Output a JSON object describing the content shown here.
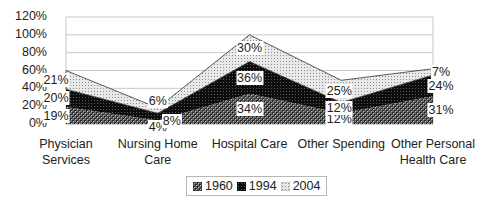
{
  "chart_data": {
    "type": "area",
    "stacked": true,
    "title": "",
    "xlabel": "",
    "ylabel": "",
    "ylim": [
      0,
      120
    ],
    "yticks": [
      "0%",
      "20%",
      "40%",
      "60%",
      "80%",
      "100%",
      "120%"
    ],
    "grid": true,
    "legend_position": "bottom",
    "categories": [
      "Physician Services",
      "Nursing Home Care",
      "Hospital Care",
      "Other Spending",
      "Other Personal Health Care"
    ],
    "category_lines": [
      [
        "Physician",
        "Services"
      ],
      [
        "Nursing Home",
        "Care"
      ],
      [
        "Hospital Care"
      ],
      [
        "Other Spending"
      ],
      [
        "Other Personal",
        "Health Care"
      ]
    ],
    "series": [
      {
        "name": "1960",
        "values": [
          19,
          4,
          34,
          12,
          31
        ],
        "labels": [
          "19%",
          "4%",
          "34%",
          "12%",
          "31%"
        ],
        "pattern": "checker"
      },
      {
        "name": "1994",
        "values": [
          20,
          8,
          36,
          12,
          24
        ],
        "labels": [
          "20%",
          "8%",
          "36%",
          "12%",
          "24%"
        ],
        "pattern": "dark-dots"
      },
      {
        "name": "2004",
        "values": [
          21,
          6,
          30,
          25,
          7
        ],
        "labels": [
          "21%",
          "6%",
          "30%",
          "25%",
          "7%"
        ],
        "pattern": "light-dots"
      }
    ]
  },
  "legend": {
    "items": [
      "1960",
      "1994",
      "2004"
    ]
  }
}
